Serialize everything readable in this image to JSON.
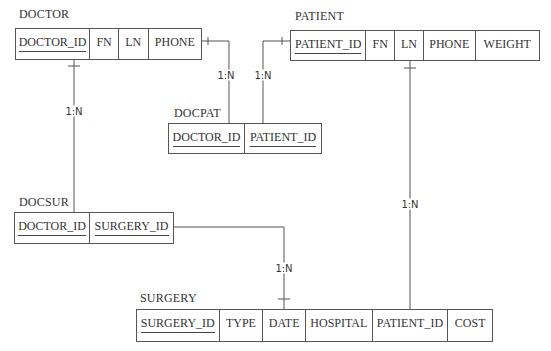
{
  "diagram": {
    "type": "entity-relationship",
    "entities": [
      {
        "id": "doctor",
        "name": "DOCTOR",
        "columns": [
          {
            "name": "DOCTOR_ID",
            "primary_key": true
          },
          {
            "name": "FN",
            "primary_key": false
          },
          {
            "name": "LN",
            "primary_key": false
          },
          {
            "name": "PHONE",
            "primary_key": false
          }
        ]
      },
      {
        "id": "patient",
        "name": "PATIENT",
        "columns": [
          {
            "name": "PATIENT_ID",
            "primary_key": true
          },
          {
            "name": "FN",
            "primary_key": false
          },
          {
            "name": "LN",
            "primary_key": false
          },
          {
            "name": "PHONE",
            "primary_key": false
          },
          {
            "name": "WEIGHT",
            "primary_key": false
          }
        ]
      },
      {
        "id": "docpat",
        "name": "DOCPAT",
        "columns": [
          {
            "name": "DOCTOR_ID",
            "primary_key": true
          },
          {
            "name": "PATIENT_ID",
            "primary_key": true
          }
        ]
      },
      {
        "id": "docsur",
        "name": "DOCSUR",
        "columns": [
          {
            "name": "DOCTOR_ID",
            "primary_key": true
          },
          {
            "name": "SURGERY_ID",
            "primary_key": true
          }
        ]
      },
      {
        "id": "surgery",
        "name": "SURGERY",
        "columns": [
          {
            "name": "SURGERY_ID",
            "primary_key": true
          },
          {
            "name": "TYPE",
            "primary_key": false
          },
          {
            "name": "DATE",
            "primary_key": false
          },
          {
            "name": "HOSPITAL",
            "primary_key": false
          },
          {
            "name": "PATIENT_ID",
            "primary_key": false
          },
          {
            "name": "COST",
            "primary_key": false
          }
        ]
      }
    ],
    "relationships": [
      {
        "from": "DOCTOR",
        "to": "DOCPAT",
        "cardinality": "1:N"
      },
      {
        "from": "PATIENT",
        "to": "DOCPAT",
        "cardinality": "1:N"
      },
      {
        "from": "DOCTOR",
        "to": "DOCSUR",
        "cardinality": "1:N"
      },
      {
        "from": "PATIENT",
        "to": "SURGERY",
        "cardinality": "1:N"
      },
      {
        "from": "DOCSUR",
        "to": "SURGERY",
        "cardinality": "1:N"
      }
    ]
  },
  "colors": {
    "line": "#555555",
    "text": "#333333",
    "background": "#ffffff"
  }
}
